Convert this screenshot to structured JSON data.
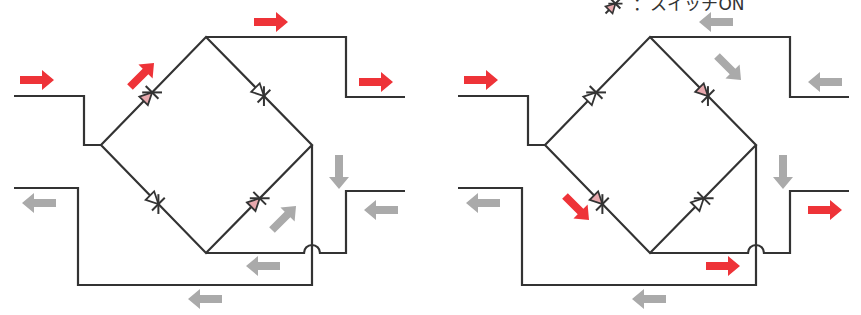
{
  "legend": {
    "left_text": "",
    "right_symbol": "switch-symbol",
    "right_text": "：スイッチON"
  },
  "colors": {
    "wire": "#333333",
    "active_arrow": "#ee3338",
    "inactive_arrow": "#aaaaaa",
    "switch_on_fill": "#e8a8ad",
    "switch_off_fill": "#ffffff"
  },
  "diagrams": [
    {
      "id": "left",
      "offset_x": 0,
      "switches": [
        {
          "position": "upper-left",
          "on": true
        },
        {
          "position": "upper-right",
          "on": false
        },
        {
          "position": "lower-left",
          "on": false
        },
        {
          "position": "lower-right",
          "on": true
        }
      ],
      "arrows": [
        {
          "x": 20,
          "y": 80,
          "dir": "right",
          "active": true
        },
        {
          "x": 254,
          "y": 22,
          "dir": "right",
          "active": true
        },
        {
          "x": 125,
          "y": 75,
          "dir": "up-right",
          "active": true
        },
        {
          "x": 359,
          "y": 82,
          "dir": "right",
          "active": true
        },
        {
          "x": 22,
          "y": 203,
          "dir": "left",
          "active": false
        },
        {
          "x": 322,
          "y": 172,
          "dir": "down",
          "active": false
        },
        {
          "x": 364,
          "y": 210,
          "dir": "left",
          "active": false
        },
        {
          "x": 267,
          "y": 218,
          "dir": "up-right",
          "active": false
        },
        {
          "x": 246,
          "y": 266,
          "dir": "left",
          "active": false
        },
        {
          "x": 188,
          "y": 299,
          "dir": "left",
          "active": false
        }
      ]
    },
    {
      "id": "right",
      "offset_x": 444,
      "switches": [
        {
          "position": "upper-left",
          "on": false
        },
        {
          "position": "upper-right",
          "on": true
        },
        {
          "position": "lower-left",
          "on": true
        },
        {
          "position": "lower-right",
          "on": false
        }
      ],
      "arrows": [
        {
          "x": 20,
          "y": 80,
          "dir": "right",
          "active": true
        },
        {
          "x": 255,
          "y": 22,
          "dir": "left",
          "active": false
        },
        {
          "x": 268,
          "y": 68,
          "dir": "down-right",
          "active": false
        },
        {
          "x": 364,
          "y": 82,
          "dir": "left",
          "active": false
        },
        {
          "x": 22,
          "y": 203,
          "dir": "left",
          "active": false
        },
        {
          "x": 322,
          "y": 172,
          "dir": "down",
          "active": false
        },
        {
          "x": 364,
          "y": 210,
          "dir": "right",
          "active": true
        },
        {
          "x": 116,
          "y": 208,
          "dir": "down-right",
          "active": true
        },
        {
          "x": 262,
          "y": 266,
          "dir": "right",
          "active": true
        },
        {
          "x": 188,
          "y": 299,
          "dir": "left",
          "active": false
        }
      ]
    }
  ]
}
